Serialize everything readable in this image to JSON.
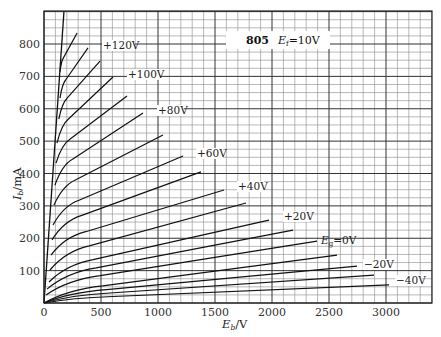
{
  "chart_data": {
    "type": "line",
    "title": "805",
    "subtitle": "E_f=10V",
    "xlabel": "E_b/V",
    "ylabel": "I_b/mA",
    "xlim": [
      0,
      3400
    ],
    "ylim": [
      0,
      900
    ],
    "x_ticks": [
      0,
      500,
      1000,
      1500,
      2000,
      2500,
      3000
    ],
    "y_ticks": [
      100,
      200,
      300,
      400,
      500,
      600,
      700,
      800
    ],
    "grid": true,
    "grid_minor_x_step": 100,
    "grid_minor_y_step": 25,
    "legend": "none (inline curve labels)",
    "boundary_line": {
      "name": "Eb=Ec boundary",
      "points": [
        [
          0,
          0
        ],
        [
          175,
          900
        ]
      ]
    },
    "series": [
      {
        "name": "+130V",
        "label_visible": false,
        "points": [
          [
            140,
            714
          ],
          [
            290,
            834
          ]
        ]
      },
      {
        "name": "+120V",
        "label_visible": true,
        "points": [
          [
            140,
            633
          ],
          [
            386,
            788
          ]
        ]
      },
      {
        "name": "+110V",
        "label_visible": false,
        "points": [
          [
            130,
            568
          ],
          [
            491,
            747
          ]
        ]
      },
      {
        "name": "+100V",
        "label_visible": true,
        "points": [
          [
            114,
            494
          ],
          [
            605,
            698
          ]
        ]
      },
      {
        "name": "+90V",
        "label_visible": false,
        "points": [
          [
            105,
            432
          ],
          [
            728,
            639
          ]
        ]
      },
      {
        "name": "+80V",
        "label_visible": true,
        "points": [
          [
            96,
            364
          ],
          [
            868,
            587
          ]
        ]
      },
      {
        "name": "+70V",
        "label_visible": false,
        "points": [
          [
            88,
            303
          ],
          [
            1044,
            519
          ]
        ]
      },
      {
        "name": "+60V",
        "label_visible": true,
        "points": [
          [
            79,
            241
          ],
          [
            1219,
            454
          ]
        ]
      },
      {
        "name": "+50V",
        "label_visible": false,
        "points": [
          [
            70,
            195
          ],
          [
            1377,
            405
          ]
        ]
      },
      {
        "name": "+40V",
        "label_visible": true,
        "points": [
          [
            61,
            148
          ],
          [
            1579,
            349
          ]
        ]
      },
      {
        "name": "+30V",
        "label_visible": false,
        "points": [
          [
            53,
            102
          ],
          [
            1772,
            309
          ]
        ]
      },
      {
        "name": "+20V",
        "label_visible": true,
        "points": [
          [
            44,
            65
          ],
          [
            1974,
            256
          ]
        ]
      },
      {
        "name": "+10V",
        "label_visible": false,
        "points": [
          [
            26,
            43
          ],
          [
            2184,
            225
          ]
        ]
      },
      {
        "name": "Eg=0V",
        "label_visible": true,
        "points": [
          [
            18,
            25
          ],
          [
            2395,
            191
          ]
        ]
      },
      {
        "name": "-10V",
        "label_visible": false,
        "points": [
          [
            0,
            0
          ],
          [
            2570,
            148
          ]
        ]
      },
      {
        "name": "-20V",
        "label_visible": true,
        "points": [
          [
            0,
            0
          ],
          [
            2746,
            114
          ]
        ]
      },
      {
        "name": "-30V",
        "label_visible": false,
        "points": [
          [
            0,
            0
          ],
          [
            2895,
            86
          ]
        ]
      },
      {
        "name": "-40V",
        "label_visible": true,
        "points": [
          [
            0,
            0
          ],
          [
            3026,
            56
          ]
        ]
      }
    ],
    "annotations": [
      "+120V",
      "+100V",
      "+80V",
      "+60V",
      "+40V",
      "+20V",
      "Eg=0V",
      "-20V",
      "-40V"
    ]
  },
  "labels": {
    "tube": "805",
    "filament": "=10V",
    "filament_sym": "E",
    "filament_sub": "f",
    "xaxis_sym": "E",
    "xaxis_sub": "b",
    "xaxis_unit": "/V",
    "yaxis_sym": "I",
    "yaxis_sub": "b",
    "yaxis_unit": "/mA",
    "eg_sym": "E",
    "eg_sub": "g",
    "eg_val": "=0V"
  }
}
